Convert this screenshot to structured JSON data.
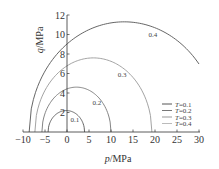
{
  "chart_data": {
    "type": "line",
    "title": "",
    "xlabel": "p/MPa",
    "ylabel": "q/MPa",
    "xlim": [
      -10,
      30
    ],
    "ylim": [
      0,
      12
    ],
    "x_ticks": [
      "-10",
      "-5",
      "0",
      "5",
      "10",
      "15",
      "20",
      "25",
      "30"
    ],
    "y_ticks": [
      "2",
      "4",
      "6",
      "8",
      "10",
      "12"
    ],
    "grid": false,
    "legend_position": "lower right",
    "series": [
      {
        "name": "T=0.1",
        "label": "0.1",
        "color": "#555555",
        "p_left": -4.3,
        "p_right": 4.0,
        "p_peak": -0.15,
        "q_peak": 2.2,
        "label_pos": [
          1.8,
          1.0
        ]
      },
      {
        "name": "T=0.2",
        "label": "0.2",
        "color": "#777777",
        "p_left": -5.7,
        "p_right": 10.0,
        "p_peak": 2.15,
        "q_peak": 4.6,
        "label_pos": [
          6.8,
          2.8
        ]
      },
      {
        "name": "T=0.3",
        "label": "0.3",
        "color": "#999999",
        "p_left": -7.3,
        "p_right": 19.3,
        "p_peak": 6.0,
        "q_peak": 7.6,
        "label_pos": [
          12.5,
          5.6
        ]
      },
      {
        "name": "T=0.4",
        "label": "0.4",
        "color": "#555555",
        "p_left": -8.6,
        "p_right": 34.6,
        "p_peak": 13.0,
        "q_peak": 11.3,
        "label_pos": [
          19.5,
          9.7
        ]
      }
    ]
  },
  "legend": {
    "items": [
      {
        "label": "T=0.1",
        "color": "#555555"
      },
      {
        "label": "T=0.2",
        "color": "#777777"
      },
      {
        "label": "T=0.3",
        "color": "#999999"
      },
      {
        "label": "T=0.4",
        "color": "#bbbbbb"
      }
    ]
  }
}
